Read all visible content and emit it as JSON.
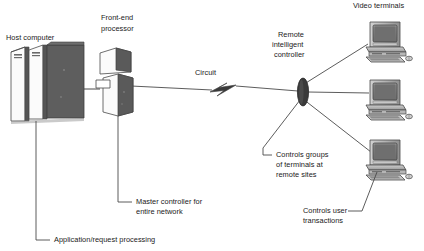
{
  "figure": {
    "kind": "network-topology-diagram",
    "background_color": "#ffffff",
    "text_color": "#1a1a1a",
    "line_color": "#4a4a4a"
  },
  "labels": {
    "host_computer": "Host computer",
    "front_end_processor_line1": "Front-end",
    "front_end_processor_line2": "processor",
    "circuit": "Circuit",
    "remote_controller_line1": "Remote",
    "remote_controller_line2": "intelligent",
    "remote_controller_line3": "controller",
    "video_terminals": "Video terminals",
    "callout_master_line1": "Master controller for",
    "callout_master_line2": "entire network",
    "callout_application": "Application/request processing",
    "callout_groups_line1": "Controls groups",
    "callout_groups_line2": "of terminals at",
    "callout_groups_line3": "remote sites",
    "callout_user_line1": "Controls user",
    "callout_user_line2": "transactions"
  },
  "nodes": [
    {
      "id": "host-computer",
      "label": "Host computer",
      "role": "mainframe",
      "x": 10,
      "y": 45,
      "w": 74,
      "h": 76
    },
    {
      "id": "front-end-processor",
      "label": "Front-end processor",
      "role": "communications-processor",
      "x": 96,
      "y": 48,
      "w": 44,
      "h": 67
    },
    {
      "id": "remote-intelligent-controller",
      "label": "Remote intelligent controller",
      "role": "cluster-controller",
      "x": 297,
      "y": 78,
      "w": 12,
      "h": 28
    },
    {
      "id": "video-terminal-1",
      "label": "Video terminals",
      "role": "terminal",
      "x": 366,
      "y": 22,
      "w": 46,
      "h": 38
    },
    {
      "id": "video-terminal-2",
      "label": "Video terminals",
      "role": "terminal",
      "x": 366,
      "y": 80,
      "w": 46,
      "h": 38
    },
    {
      "id": "video-terminal-3",
      "label": "Video terminals",
      "role": "terminal",
      "x": 366,
      "y": 140,
      "w": 46,
      "h": 38
    }
  ],
  "links": [
    {
      "from": "host-computer",
      "to": "front-end-processor",
      "style": "solid"
    },
    {
      "from": "front-end-processor",
      "to": "remote-intelligent-controller",
      "style": "circuit-with-lightning-bolt"
    },
    {
      "from": "remote-intelligent-controller",
      "to": "video-terminal-1",
      "style": "solid"
    },
    {
      "from": "remote-intelligent-controller",
      "to": "video-terminal-2",
      "style": "solid"
    },
    {
      "from": "remote-intelligent-controller",
      "to": "video-terminal-3",
      "style": "solid"
    }
  ],
  "callouts": [
    {
      "id": "application-request-processing",
      "target": "host-computer",
      "text": "Application/request processing"
    },
    {
      "id": "master-controller",
      "target": "front-end-processor",
      "text": "Master controller for entire network"
    },
    {
      "id": "controls-groups",
      "target": "remote-intelligent-controller",
      "text": "Controls groups of terminals at remote sites"
    },
    {
      "id": "controls-user-transactions",
      "target": "video-terminal-3",
      "text": "Controls user transactions"
    }
  ]
}
